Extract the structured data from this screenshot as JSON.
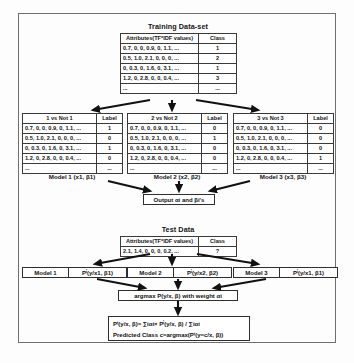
{
  "diagram": {
    "title_training": "Training Data-set",
    "title_test": "Test Data"
  },
  "training_table": {
    "headers": [
      "Attributes(TF*IDF values)",
      "Class"
    ],
    "rows": [
      {
        "attributes": "0.7, 0, 0, 0.9, 0, 1.1, ...",
        "class": "1"
      },
      {
        "attributes": "0.5, 1.0, 2.1, 0, 0, 0, ...",
        "class": "2"
      },
      {
        "attributes": "0, 0.3, 0, 1.6, 0, 3.1, ...",
        "class": "1"
      },
      {
        "attributes": "1.2, 0, 2.8, 0, 0, 0.4, ...",
        "class": "3"
      },
      {
        "attributes": "...",
        "class": "..."
      }
    ]
  },
  "ovr_tables": [
    {
      "headers": [
        "1 vs Not 1",
        "Label"
      ],
      "rows": [
        {
          "attributes": "0.7, 0, 0, 0.9, 0, 1.1, ...",
          "label": "1"
        },
        {
          "attributes": "0.5, 1.0, 2.1, 0, 0, 0, ...",
          "label": "0"
        },
        {
          "attributes": "0, 0.3, 0, 1.6, 0, 3.1, ...",
          "label": "1"
        },
        {
          "attributes": "1.2, 0, 2.8, 0, 0, 0.4, ...",
          "label": "0"
        },
        {
          "attributes": "...",
          "label": "..."
        }
      ],
      "caption": "Model 1 (x1, β1)"
    },
    {
      "headers": [
        "2 vs Not 2",
        "Label"
      ],
      "rows": [
        {
          "attributes": "0.7, 0, 0, 0.9, 0, 1.1, ...",
          "label": "0"
        },
        {
          "attributes": "0.5, 1.0, 2.1, 0, 0, 0, ...",
          "label": "1"
        },
        {
          "attributes": "0, 0.3, 0, 1.6, 0, 3.1, ...",
          "label": "0"
        },
        {
          "attributes": "1.2, 0, 2.8, 0, 0, 0.4, ...",
          "label": "0"
        },
        {
          "attributes": "...",
          "label": "..."
        }
      ],
      "caption": "Model 2 (x2, β2)"
    },
    {
      "headers": [
        "3 vs Not 3",
        "Label"
      ],
      "rows": [
        {
          "attributes": "0.7, 0, 0, 0.9, 0, 1.1, ...",
          "label": "0"
        },
        {
          "attributes": "0.5, 1.0, 2.1, 0, 0, 0, ...",
          "label": "0"
        },
        {
          "attributes": "0, 0.3, 0, 1.6, 0, 3.1, ...",
          "label": "0"
        },
        {
          "attributes": "1.2, 0, 2.8, 0, 0, 0.4, ...",
          "label": "1"
        },
        {
          "attributes": "...",
          "label": "..."
        }
      ],
      "caption": "Model 3 (x3, β3)"
    }
  ],
  "output_box": {
    "label": "Output αi and βi's"
  },
  "test_table": {
    "headers": [
      "Attributes(TF*IDF values)",
      "Class"
    ],
    "rows": [
      {
        "attributes": "2.1, 1.4, 0, 0, 0, 0.2, ...",
        "class": "?"
      }
    ]
  },
  "test_models": [
    {
      "name": "Model 1",
      "probability": "Pⁱ(y/x1, β1)"
    },
    {
      "name": "Model 2",
      "probability": "Pⁱ(y/x2, β2)"
    },
    {
      "name": "Model 3",
      "probability": "Pⁱ(y/x1, β1)"
    }
  ],
  "argmax_box": {
    "label": "argmax P(y/x, β) with weight αi"
  },
  "final_box": {
    "line1": "Pᵗ(y/x, β)= ∑iαi× Pⁱ(y/x, β) / ∑iαi",
    "line2": "Predicted Class c=argmax(Pᵗ(y=c/x, β))"
  },
  "colors": {
    "frame": "#6f6f6f",
    "line": "#2e2e2e",
    "arrow": "#111111",
    "background": "#fdfdfd"
  }
}
